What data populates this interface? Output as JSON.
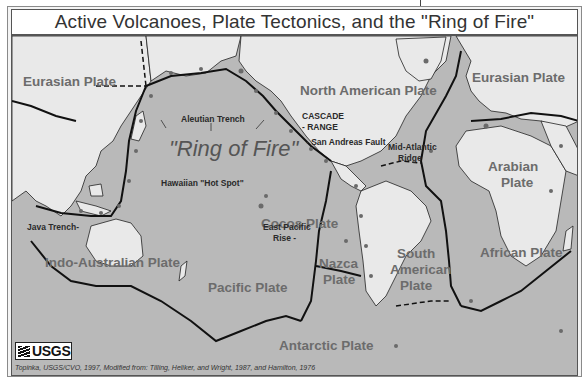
{
  "title": "Active Volcanoes, Plate Tectonics, and the \"Ring of Fire\"",
  "colors": {
    "ocean": "#b9b9b9",
    "land": "#e9e9e9",
    "plate_boundary": "#111111",
    "volcano": "#6a6a6a",
    "label": "#6c6c6c"
  },
  "plate_labels": [
    {
      "id": "eurasian-west",
      "text": "Eurasian Plate"
    },
    {
      "id": "north-american",
      "text": "North American Plate"
    },
    {
      "id": "eurasian-east",
      "text": "Eurasian Plate"
    },
    {
      "id": "arabian-1",
      "text": "Arabian"
    },
    {
      "id": "arabian-2",
      "text": "Plate"
    },
    {
      "id": "cocos",
      "text": "Cocos Plate"
    },
    {
      "id": "nazca-1",
      "text": "Nazca"
    },
    {
      "id": "nazca-2",
      "text": "Plate"
    },
    {
      "id": "south-american-1",
      "text": "South"
    },
    {
      "id": "south-american-2",
      "text": "American"
    },
    {
      "id": "south-american-3",
      "text": "Plate"
    },
    {
      "id": "african",
      "text": "African Plate"
    },
    {
      "id": "indo-australian",
      "text": "Indo-Australian Plate"
    },
    {
      "id": "pacific",
      "text": "Pacific Plate"
    },
    {
      "id": "antarctic",
      "text": "Antarctic Plate"
    }
  ],
  "feature_labels": [
    {
      "id": "aleutian",
      "text": "Aleutian Trench"
    },
    {
      "id": "cascade-1",
      "text": "CASCADE"
    },
    {
      "id": "cascade-2",
      "text": "- RANGE"
    },
    {
      "id": "san-andreas",
      "text": "- San Andreas Fault"
    },
    {
      "id": "mid-atlantic-1",
      "text": "Mid-Atlantic"
    },
    {
      "id": "mid-atlantic-2",
      "text": "Ridge"
    },
    {
      "id": "hawaiian",
      "text": "Hawaiian \"Hot Spot\""
    },
    {
      "id": "java",
      "text": "Java Trench-"
    },
    {
      "id": "east-pacific-1",
      "text": "East Pacific"
    },
    {
      "id": "east-pacific-2",
      "text": "Rise -"
    }
  ],
  "ring_of_fire": "\"Ring of Fire\"",
  "logo": "USGS",
  "credit": "Topinka, USGS/CVO, 1997, Modified from: Tilling, Heliker, and Wright, 1987, and Hamilton, 1976"
}
